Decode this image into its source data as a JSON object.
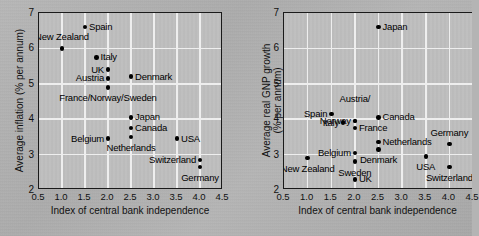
{
  "figure": {
    "background_color": "#b2b2b2",
    "plot_background_color": "#c2c2c2",
    "gridline_color": "#eeeeee",
    "marker_color": "#000000"
  },
  "chart_data": [
    {
      "id": "inflation",
      "type": "scatter",
      "title": "",
      "xlabel": "Index of central bank independence",
      "ylabel": "Average inflation (% per annum)",
      "xlim": [
        0.5,
        4.5
      ],
      "ylim": [
        2,
        7
      ],
      "xticks": [
        "0.5",
        "1.0",
        "1.5",
        "2.0",
        "2.5",
        "3.0",
        "3.5",
        "4.0",
        "4.5"
      ],
      "xtick_values": [
        0.5,
        1.0,
        1.5,
        2.0,
        2.5,
        3.0,
        3.5,
        4.0,
        4.5
      ],
      "yticks": [
        "2",
        "3",
        "4",
        "5",
        "6",
        "7"
      ],
      "ytick_values": [
        2,
        3,
        4,
        5,
        6,
        7
      ],
      "grid": true,
      "legend": "none",
      "points": [
        {
          "label": "Spain",
          "x": 1.5,
          "y": 6.6,
          "label_side": "right"
        },
        {
          "label": "New Zealand",
          "x": 1.0,
          "y": 6.0,
          "label_side": "above"
        },
        {
          "label": "Italy",
          "x": 1.75,
          "y": 5.75,
          "label_side": "right"
        },
        {
          "label": "UK",
          "x": 2.0,
          "y": 5.4,
          "label_side": "left"
        },
        {
          "label": "Austria",
          "x": 2.0,
          "y": 5.15,
          "label_side": "left"
        },
        {
          "label": "Denmark",
          "x": 2.5,
          "y": 5.2,
          "label_side": "right"
        },
        {
          "label": "France/Norway/Sweden",
          "x": 2.0,
          "y": 4.9,
          "label_side": "below"
        },
        {
          "label": "Japan",
          "x": 2.5,
          "y": 4.05,
          "label_side": "right"
        },
        {
          "label": "Canada",
          "x": 2.5,
          "y": 3.75,
          "label_side": "right"
        },
        {
          "label": "Netherlands",
          "x": 2.5,
          "y": 3.5,
          "label_side": "below"
        },
        {
          "label": "Belgium",
          "x": 2.0,
          "y": 3.45,
          "label_side": "left"
        },
        {
          "label": "USA",
          "x": 3.5,
          "y": 3.45,
          "label_side": "right"
        },
        {
          "label": "Switzerland",
          "x": 4.0,
          "y": 2.85,
          "label_side": "left"
        },
        {
          "label": "Germany",
          "x": 4.0,
          "y": 2.65,
          "label_side": "below"
        }
      ]
    },
    {
      "id": "gnp-growth",
      "type": "scatter",
      "title": "",
      "xlabel": "Index of central bank independence",
      "ylabel": "Average real GNP growth (% per annum)",
      "ylabel_line1": "Average real GNP growth",
      "ylabel_line2": "(% per annum)",
      "xlim": [
        0.5,
        4.5
      ],
      "ylim": [
        2,
        7
      ],
      "xticks": [
        "0.5",
        "1.0",
        "1.5",
        "2.0",
        "2.5",
        "3.0",
        "3.5",
        "4.0",
        "4.5"
      ],
      "xtick_values": [
        0.5,
        1.0,
        1.5,
        2.0,
        2.5,
        3.0,
        3.5,
        4.0,
        4.5
      ],
      "yticks": [
        "2",
        "3",
        "4",
        "5",
        "6",
        "7"
      ],
      "ytick_values": [
        2,
        3,
        4,
        5,
        6,
        7
      ],
      "grid": true,
      "legend": "none",
      "cropped_right_edge": true,
      "points": [
        {
          "label": "Japan",
          "x": 2.5,
          "y": 6.6,
          "label_side": "right"
        },
        {
          "label": "Canada",
          "x": 2.5,
          "y": 4.05,
          "label_side": "right"
        },
        {
          "label": "Spain",
          "x": 1.5,
          "y": 4.15,
          "label_side": "left"
        },
        {
          "label": "Austria/",
          "x": 2.0,
          "y": 3.95,
          "label_side": "above2"
        },
        {
          "label": "Norway",
          "x": 2.0,
          "y": 3.95,
          "label_side": "left"
        },
        {
          "label": "Italy",
          "x": 1.75,
          "y": 3.9,
          "label_side": "left"
        },
        {
          "label": "France",
          "x": 2.0,
          "y": 3.75,
          "label_side": "right"
        },
        {
          "label": "Germany",
          "x": 4.0,
          "y": 3.3,
          "label_side": "above"
        },
        {
          "label": "Netherlands",
          "x": 2.5,
          "y": 3.35,
          "label_side": "right"
        },
        {
          "label": "Denmark",
          "x": 2.5,
          "y": 3.15,
          "label_side": "below"
        },
        {
          "label": "Belgium",
          "x": 2.0,
          "y": 3.05,
          "label_side": "left"
        },
        {
          "label": "USA",
          "x": 3.5,
          "y": 2.95,
          "label_side": "below"
        },
        {
          "label": "New Zealand",
          "x": 1.0,
          "y": 2.9,
          "label_side": "below"
        },
        {
          "label": "Sweden",
          "x": 2.0,
          "y": 2.8,
          "label_side": "below"
        },
        {
          "label": "Switzerland",
          "x": 4.0,
          "y": 2.65,
          "label_side": "below"
        },
        {
          "label": "UK",
          "x": 2.0,
          "y": 2.3,
          "label_side": "right"
        }
      ]
    }
  ]
}
